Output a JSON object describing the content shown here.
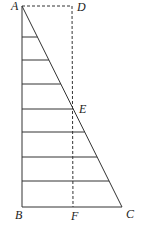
{
  "diagram": {
    "colors": {
      "line": "#333333",
      "label": "#222222",
      "background": "#ffffff"
    },
    "points": {
      "A": {
        "label": "A",
        "x": 22,
        "y": 6
      },
      "D": {
        "label": "D",
        "x": 72,
        "y": 6
      },
      "E": {
        "label": "E",
        "x": 72,
        "y": 109
      },
      "B": {
        "label": "B",
        "x": 22,
        "y": 207
      },
      "F": {
        "label": "F",
        "x": 73,
        "y": 207
      },
      "C": {
        "label": "C",
        "x": 122,
        "y": 207
      }
    },
    "labels": {
      "A": "A",
      "B": "B",
      "C": "C",
      "D": "D",
      "E": "E",
      "F": "F"
    },
    "horizontal_strip_ys": [
      37,
      60,
      84,
      109,
      132,
      157,
      181
    ]
  }
}
